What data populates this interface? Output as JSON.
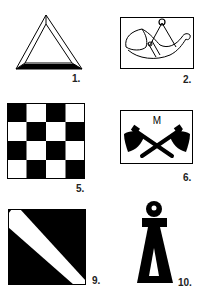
{
  "figures": [
    {
      "id": 1,
      "label": "1.",
      "icon": "triangle-icon"
    },
    {
      "id": 2,
      "label": "2.",
      "icon": "bugle-horn-icon"
    },
    {
      "id": 5,
      "label": "5.",
      "icon": "checkerboard-icon"
    },
    {
      "id": 6,
      "label": "6.",
      "icon": "crossed-axes-icon",
      "letter": "M"
    },
    {
      "id": 9,
      "label": "9.",
      "icon": "diagonal-stripe-flag-icon"
    },
    {
      "id": 10,
      "label": "10.",
      "icon": "ankh-pyramid-icon"
    }
  ],
  "colors": {
    "ink": "#000000",
    "paper": "#ffffff"
  }
}
